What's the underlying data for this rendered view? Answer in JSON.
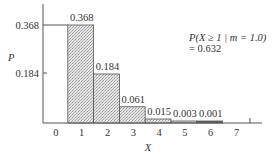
{
  "chart_data": {
    "type": "bar",
    "title": "",
    "xlabel": "X",
    "ylabel": "P",
    "categories": [
      "0",
      "1",
      "2",
      "3",
      "4",
      "5",
      "6",
      "7"
    ],
    "values": [
      0,
      0.368,
      0.184,
      0.061,
      0.015,
      0.003,
      0.001,
      0
    ],
    "bar_labels": [
      "",
      "0.368",
      "0.184",
      "0.061",
      "0.015",
      "0.003",
      "0.001",
      ""
    ],
    "yticks": [
      "0.184",
      "0.368"
    ],
    "ylim": [
      0,
      0.4
    ],
    "grid": false,
    "legend": null,
    "annotation": {
      "line1": "P(X ≥ 1 | m = 1.0)",
      "line2": "= 0.632"
    }
  }
}
